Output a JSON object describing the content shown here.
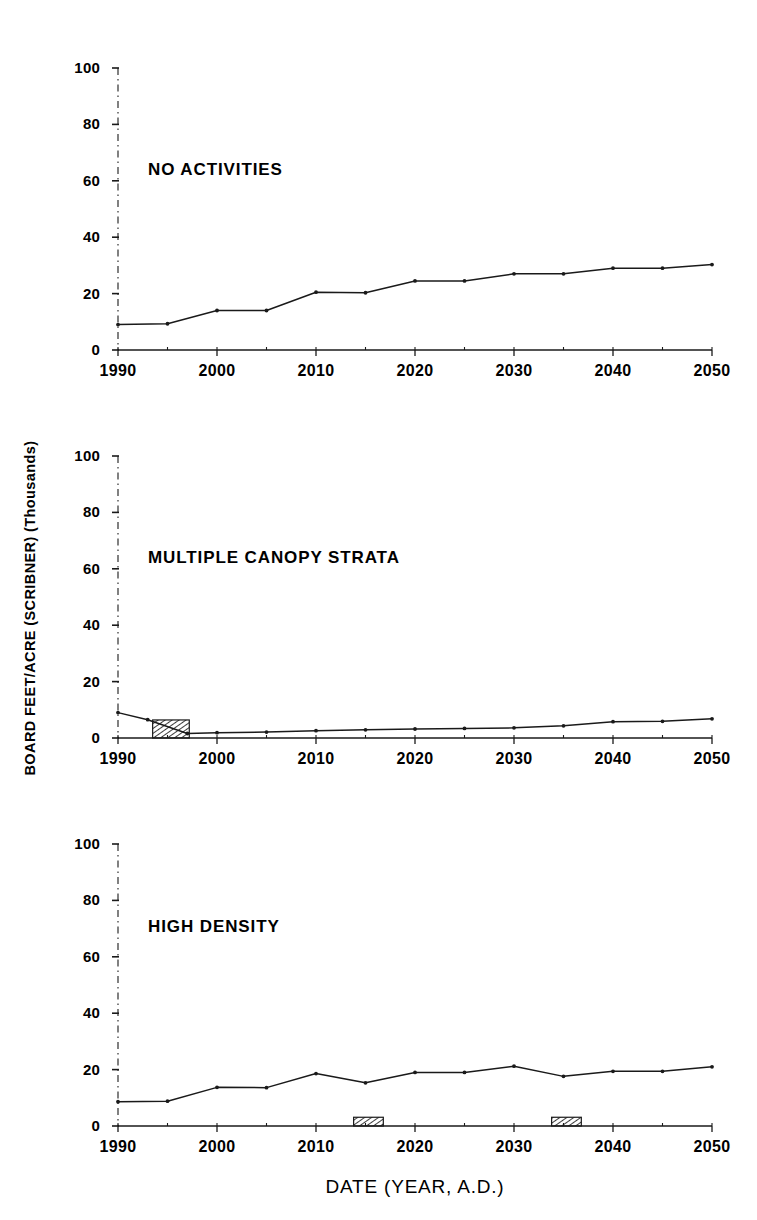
{
  "figure": {
    "ylabel": "BOARD FEET/ACRE (SCRIBNER) (Thousands)",
    "xlabel": "DATE (YEAR, A.D.)",
    "line_color": "#1a1a1a",
    "axis_color": "#1a1a1a",
    "hatch_color": "#1a1a1a",
    "background": "#ffffff"
  },
  "chart_data": [
    {
      "type": "line",
      "title": "NO ACTIVITIES",
      "panel_index": 1,
      "xlabel": "",
      "ylabel": "BOARD FEET/ACRE (SCRIBNER) (Thousands)",
      "xlim": [
        1990,
        2050
      ],
      "ylim": [
        0,
        100
      ],
      "ytick_labels": [
        "0",
        "20",
        "40",
        "60",
        "80",
        "100"
      ],
      "yticks": [
        0,
        20,
        40,
        60,
        80,
        100
      ],
      "xtick_labels": [
        "1990",
        "2000",
        "2010",
        "2020",
        "2030",
        "2040",
        "2050"
      ],
      "xticks": [
        1990,
        2000,
        2010,
        2020,
        2030,
        2040,
        2050
      ],
      "grid": false,
      "legend": "none",
      "x": [
        1990,
        1995,
        2000,
        2005,
        2010,
        2015,
        2020,
        2025,
        2030,
        2035,
        2040,
        2045,
        2050
      ],
      "values": [
        9,
        9.3,
        14,
        14,
        20.5,
        20.3,
        24.5,
        24.5,
        27,
        27,
        29,
        29,
        30.3
      ],
      "harvest_bars": []
    },
    {
      "type": "line",
      "title": "MULTIPLE CANOPY STRATA",
      "panel_index": 2,
      "xlabel": "",
      "ylabel": "BOARD FEET/ACRE (SCRIBNER) (Thousands)",
      "xlim": [
        1990,
        2050
      ],
      "ylim": [
        0,
        100
      ],
      "ytick_labels": [
        "0",
        "20",
        "40",
        "60",
        "80",
        "100"
      ],
      "yticks": [
        0,
        20,
        40,
        60,
        80,
        100
      ],
      "xtick_labels": [
        "1990",
        "2000",
        "2010",
        "2020",
        "2030",
        "2040",
        "2050"
      ],
      "xticks": [
        1990,
        2000,
        2010,
        2020,
        2030,
        2040,
        2050
      ],
      "grid": false,
      "legend": "none",
      "x": [
        1990,
        1993,
        1997,
        2000,
        2005,
        2010,
        2015,
        2020,
        2025,
        2030,
        2035,
        2040,
        2045,
        2050
      ],
      "values": [
        9.0,
        6.5,
        1.6,
        1.9,
        2.1,
        2.6,
        2.9,
        3.2,
        3.4,
        3.6,
        4.3,
        5.8,
        5.9,
        6.8
      ],
      "harvest_bars": [
        {
          "x_start": 1993.5,
          "x_end": 1997.2,
          "height": 6.4
        }
      ]
    },
    {
      "type": "line",
      "title": "HIGH DENSITY",
      "panel_index": 3,
      "xlabel": "DATE (YEAR, A.D.)",
      "ylabel": "BOARD FEET/ACRE (SCRIBNER) (Thousands)",
      "xlim": [
        1990,
        2050
      ],
      "ylim": [
        0,
        100
      ],
      "ytick_labels": [
        "0",
        "20",
        "40",
        "60",
        "80",
        "100"
      ],
      "yticks": [
        0,
        20,
        40,
        60,
        80,
        100
      ],
      "xtick_labels": [
        "1990",
        "2000",
        "2010",
        "2020",
        "2030",
        "2040",
        "2050"
      ],
      "xticks": [
        1990,
        2000,
        2010,
        2020,
        2030,
        2040,
        2050
      ],
      "grid": false,
      "legend": "none",
      "x": [
        1990,
        1995,
        2000,
        2005,
        2010,
        2015,
        2020,
        2025,
        2030,
        2035,
        2040,
        2045,
        2050
      ],
      "values": [
        8.6,
        8.8,
        13.7,
        13.6,
        18.6,
        15.3,
        19.0,
        19.0,
        21.2,
        17.6,
        19.4,
        19.4,
        21.0
      ],
      "harvest_bars": [
        {
          "x_start": 2013.8,
          "x_end": 2016.8,
          "height": 3.1
        },
        {
          "x_start": 2033.8,
          "x_end": 2036.8,
          "height": 3.1
        }
      ]
    }
  ]
}
